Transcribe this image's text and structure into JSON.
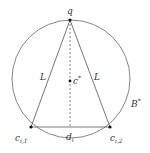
{
  "diagram": {
    "circle_label": "B",
    "circle_label_sup": "*",
    "apex_label": "q",
    "center_label": "c",
    "center_label_sup": "*",
    "left_side_label": "L",
    "right_side_label": "L",
    "base_label": "d",
    "base_label_sub": "i",
    "left_vertex_label": "c",
    "left_vertex_sub": "i,1",
    "right_vertex_label": "c",
    "right_vertex_sub": "i,2"
  }
}
